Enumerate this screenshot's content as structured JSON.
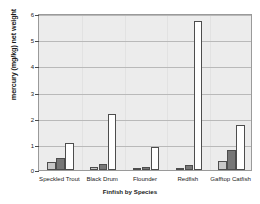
{
  "chart_data": {
    "type": "bar",
    "title": "",
    "xlabel": "Finfish by Species",
    "ylabel": "mercury (mg/kg) net weight",
    "categories": [
      "Speckled Trout",
      "Black Drum",
      "Flounder",
      "Redfish",
      "Gafftop Catfish"
    ],
    "series": [
      {
        "name": "series-1",
        "color": "#c8c8c8",
        "values": [
          0.3,
          0.1,
          0.05,
          0.08,
          0.33
        ]
      },
      {
        "name": "series-2",
        "color": "#777777",
        "values": [
          0.47,
          0.22,
          0.1,
          0.2,
          0.78
        ]
      },
      {
        "name": "series-3",
        "color": "#ffffff",
        "values": [
          1.02,
          2.13,
          0.87,
          5.68,
          1.72
        ]
      }
    ],
    "ylim": [
      0,
      6
    ],
    "yticks": [
      0,
      1,
      2,
      3,
      4,
      5,
      6
    ],
    "ytick_labels": [
      "0",
      "1",
      "2",
      "3",
      "4",
      "5",
      "6"
    ],
    "grid": true,
    "legend": "none",
    "plot_background": "#ececec",
    "axis_color": "#9a9a9a"
  }
}
